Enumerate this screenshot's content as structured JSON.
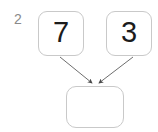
{
  "diagram": {
    "step_label": "2",
    "background_color": "#ffffff",
    "node_border_color": "#c9c9c9",
    "node_fill_color": "#ffffff",
    "digit_color": "#1c1c1c",
    "label_color": "#8a8a8a",
    "edge_color": "#6e6e6e",
    "nodes": [
      {
        "id": "addend-left",
        "value": "7",
        "role": "addend"
      },
      {
        "id": "addend-right",
        "value": "3",
        "role": "addend"
      },
      {
        "id": "sum",
        "value": "",
        "role": "result-empty"
      }
    ],
    "edges": [
      {
        "from": "addend-left",
        "to": "sum",
        "arrow": true
      },
      {
        "from": "addend-right",
        "to": "sum",
        "arrow": true
      }
    ]
  }
}
